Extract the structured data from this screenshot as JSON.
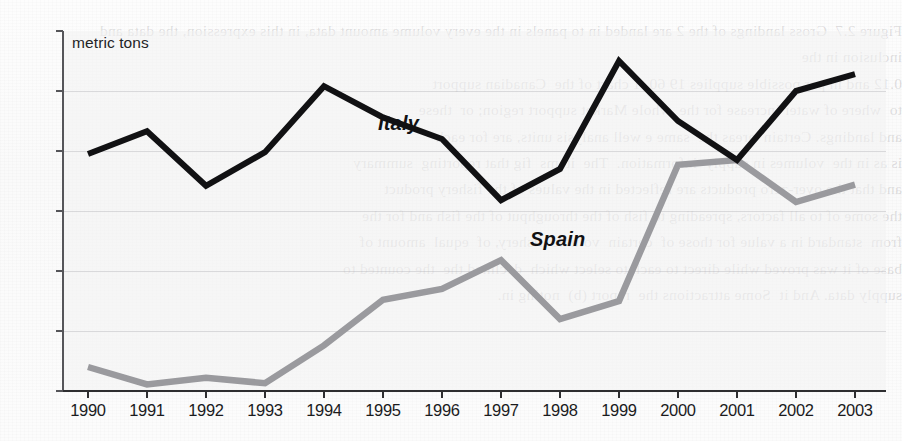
{
  "chart_data": {
    "type": "line",
    "title": "",
    "subtitle": "",
    "xlabel": "",
    "ylabel": "metric tons",
    "unit_note": "metric tons",
    "x": [
      1990,
      1991,
      1992,
      1993,
      1994,
      1995,
      1996,
      1997,
      1998,
      1999,
      2000,
      2001,
      2002,
      2003
    ],
    "categories": [
      "1990",
      "1991",
      "1992",
      "1993",
      "1994",
      "1995",
      "1996",
      "1997",
      "1998",
      "1999",
      "2000",
      "2001",
      "2002",
      "2003"
    ],
    "series": [
      {
        "name": "Italy",
        "color": "#111113",
        "values": [
          3950,
          4330,
          3420,
          3980,
          5080,
          4560,
          4200,
          3180,
          3700,
          5500,
          4500,
          3850,
          5000,
          5280
        ]
      },
      {
        "name": "Spain",
        "color": "#9a9a9e",
        "values": [
          400,
          110,
          220,
          130,
          760,
          1520,
          1700,
          2180,
          1200,
          1500,
          3770,
          3850,
          3150,
          3440
        ]
      }
    ],
    "ylim": [
      0,
      6000
    ],
    "ytick_values": [
      0,
      1000,
      2000,
      3000,
      4000,
      5000,
      6000
    ],
    "ytick_labels": [
      "0",
      "1,000",
      "2,000",
      "3,000",
      "4,000",
      "5,000",
      "6,000"
    ],
    "grid": true,
    "grid_axis": "y",
    "legend": "inline-series-labels",
    "legend_position": "on-plot"
  },
  "axis": {
    "unit_label": "metric tons"
  },
  "series_labels": {
    "italy": "Italy",
    "spain": "Spain"
  },
  "background": {
    "bleed_text": "Figure 2.7  Gross landings of the 2 are landed in to panels in the every volume amount data, in this expression, the data and inclusion in the\n0.12 and in per possible supplies 19 60  1 chart of the  Canadian support\nto  where of water increase for the  whole Market support region; or  these\nand landings. Certain  areas the  same e well analysis units, are for each\nis as in the  volumes in supply  information.  The  items  fig that reporting  summary\nand that the over-zero products are reflected in the values of the fishery product\nthe some of to all factors, spreading to fish of the throughput of the fish and for the\nfrom  standard in a value for those of  certain  volume  fishery, of  equal  amount of\nbase of it was proved while direct to each to select which  declined the  the counted to\nsupply data. And it  Some attractions the  report (b)  noting in."
  }
}
